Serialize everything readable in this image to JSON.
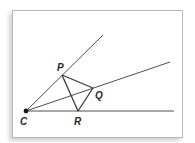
{
  "diagram": {
    "type": "geometry",
    "colors": {
      "line": "#3a3a3a",
      "label": "#2a2a2a",
      "frame_border": "#b8b8b8",
      "background": "#ffffff"
    },
    "points": {
      "C": {
        "label": "C",
        "x": 26,
        "y": 111
      },
      "P": {
        "label": "P",
        "x": 62,
        "y": 75
      },
      "Q": {
        "label": "Q",
        "x": 93,
        "y": 88
      },
      "R": {
        "label": "R",
        "x": 78,
        "y": 111
      }
    },
    "rays": [
      {
        "name": "ray-CP",
        "from": "C",
        "through": "P",
        "end": {
          "x": 103,
          "y": 35
        }
      },
      {
        "name": "ray-CQ",
        "from": "C",
        "through": "Q",
        "end": {
          "x": 170,
          "y": 62
        }
      },
      {
        "name": "ray-CR",
        "from": "C",
        "through": "R",
        "end": {
          "x": 174,
          "y": 111
        }
      }
    ],
    "segments": [
      {
        "name": "segment-PQ",
        "from": "P",
        "to": "Q"
      },
      {
        "name": "segment-QR",
        "from": "Q",
        "to": "R"
      },
      {
        "name": "segment-PR",
        "from": "P",
        "to": "R"
      }
    ],
    "labels": {
      "C": "C",
      "P": "P",
      "Q": "Q",
      "R": "R"
    }
  }
}
